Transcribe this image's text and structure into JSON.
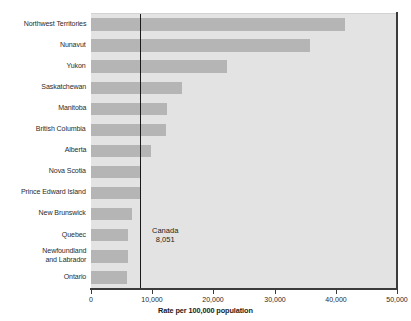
{
  "chart_data": {
    "type": "bar",
    "orientation": "horizontal",
    "title": "",
    "xlabel": "Rate per 100,000 population",
    "ylabel": "",
    "xlim": [
      0,
      50000
    ],
    "xticks": [
      0,
      10000,
      20000,
      30000,
      40000,
      50000
    ],
    "xtick_labels": [
      "0",
      "10,000",
      "20,000",
      "30,000",
      "40,000",
      "50,000"
    ],
    "grid": false,
    "legend": "none",
    "categories": [
      "Northwest Territories",
      "Nunavut",
      "Yukon",
      "Saskatchewan",
      "Manitoba",
      "British Columbia",
      "Alberta",
      "Nova Scotia",
      "Prince Edward Island",
      "New Brunswick",
      "Quebec",
      "Newfoundland and Labrador",
      "Ontario"
    ],
    "values": [
      41500,
      35800,
      22200,
      14900,
      12400,
      12200,
      9800,
      8000,
      8000,
      6700,
      6100,
      6100,
      5900
    ],
    "annotations": [
      {
        "name": "canada-reference-line",
        "label": "Canada",
        "value_label": "8,051",
        "value": 8051
      }
    ],
    "colors": {
      "bar": "#b5b5b5",
      "plot_background": "#e3e3e3",
      "axis": "#3b3b3b",
      "reference_line": "#1a1a1a",
      "text": "#231f20"
    }
  },
  "category_label_lines": [
    [
      "Northwest Territories"
    ],
    [
      "Nunavut"
    ],
    [
      "Yukon"
    ],
    [
      "Saskatchewan"
    ],
    [
      "Manitoba"
    ],
    [
      "British Columbia"
    ],
    [
      "Alberta"
    ],
    [
      "Nova Scotia"
    ],
    [
      "Prince Edward Island"
    ],
    [
      "New Brunswick"
    ],
    [
      "Quebec"
    ],
    [
      "Newfoundland",
      "and Labrador"
    ],
    [
      "Ontario"
    ]
  ]
}
